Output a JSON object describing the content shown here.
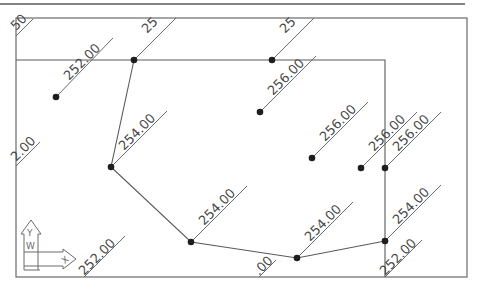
{
  "drawing": {
    "colors": {
      "background": "#ffffff",
      "line": "#5a5a5a",
      "point": "#1e1e1e",
      "label": "#4a4a4a",
      "frame": "#6a6a6a"
    },
    "top_rule": {
      "x1": 0,
      "y1": 4,
      "x2": 465,
      "y2": 4
    },
    "frame": {
      "x": 16,
      "y": 18,
      "width": 451,
      "height": 259
    },
    "boundary_line": {
      "points": "16,60 385,60 385,277"
    },
    "polygon": {
      "points": "134,60 111,167 191,242 297,258 385,241"
    },
    "survey_points": [
      {
        "x": 56,
        "y": 97
      },
      {
        "x": 134,
        "y": 60
      },
      {
        "x": 272,
        "y": 60
      },
      {
        "x": 260,
        "y": 112
      },
      {
        "x": 312,
        "y": 158
      },
      {
        "x": 361,
        "y": 168
      },
      {
        "x": 385,
        "y": 168
      },
      {
        "x": 111,
        "y": 167
      },
      {
        "x": 191,
        "y": 242
      },
      {
        "x": 297,
        "y": 258
      },
      {
        "x": 385,
        "y": 241
      }
    ],
    "labels": [
      {
        "text": "252.00",
        "x": 69,
        "y": 81,
        "leader": "56,97 113,38"
      },
      {
        "text": "25",
        "x": 147,
        "y": 34,
        "leader": "134,60 176,18"
      },
      {
        "text": "25",
        "x": 285,
        "y": 34,
        "leader": "272,60 314,18"
      },
      {
        "text": "256.00",
        "x": 273,
        "y": 96,
        "leader": "260,112 316,56"
      },
      {
        "text": "256.00",
        "x": 325,
        "y": 142,
        "leader": "312,158 368,102"
      },
      {
        "text": "256.00",
        "x": 374,
        "y": 152,
        "leader": "361,168 417,112"
      },
      {
        "text": "256.00",
        "x": 398,
        "y": 152,
        "leader": "385,168 441,112"
      },
      {
        "text": "254.00",
        "x": 124,
        "y": 151,
        "leader": "111,167 167,111"
      },
      {
        "text": "254.00",
        "x": 204,
        "y": 226,
        "leader": "191,242 247,186"
      },
      {
        "text": "254.00",
        "x": 310,
        "y": 242,
        "leader": "297,258 353,202"
      },
      {
        "text": "254.00",
        "x": 398,
        "y": 225,
        "leader": "385,241 441,185"
      },
      {
        "text": "252.00",
        "x": 385,
        "y": 276,
        "leader": "385,277 422,240"
      },
      {
        "text": "252.00",
        "x": 84,
        "y": 276,
        "leader": "84,277 125,236"
      },
      {
        "text": ".00",
        "x": 259,
        "y": 276,
        "leader": "259,277 276,260"
      },
      {
        "text": "2.00",
        "x": 16,
        "y": 162,
        "leader": "16,166 40,142"
      },
      {
        "text": "50",
        "x": 16,
        "y": 31,
        "leader": "16,36 33,19"
      }
    ],
    "ucs_icon": {
      "x_label": "X",
      "y_label": "Y",
      "w_label": "W"
    }
  }
}
